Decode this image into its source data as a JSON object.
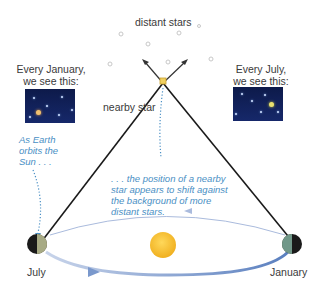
{
  "labels": {
    "distant_stars": "distant stars",
    "nearby_star": "nearby star",
    "january_view_line1": "Every January,",
    "january_view_line2": "we see this:",
    "july_view_line1": "Every July,",
    "july_view_line2": "we see this:",
    "earth_left": "July",
    "earth_right": "January"
  },
  "annotations": {
    "orbit_note_line1": "As Earth",
    "orbit_note_line2": "orbits the",
    "orbit_note_line3": "Sun . . .",
    "shift_note_line1": ". . . the position of a nearby",
    "shift_note_line2": "star appears to shift against",
    "shift_note_line3": "the background of more",
    "shift_note_line4": "distant stars."
  },
  "colors": {
    "sky": "#0d1a4a",
    "annotation": "#4a8fc4",
    "orbit": "#5a7fbf",
    "sun": "#f5c234",
    "nearby_star": "#f0d060"
  }
}
